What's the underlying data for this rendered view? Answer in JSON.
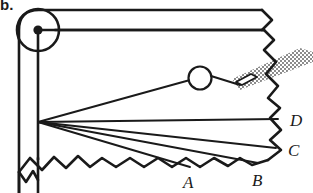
{
  "figure": {
    "title_marker": "b.",
    "type": "optics-ray-diagram",
    "background_color": "#ffffff",
    "stroke_color": "#1a1a1a",
    "hatch_color": "#9a9a9a",
    "canvas": {
      "width": 313,
      "height": 193
    },
    "labels": [
      {
        "id": "A",
        "text": "A",
        "x": 190,
        "y": 188
      },
      {
        "id": "B",
        "text": "B",
        "x": 258,
        "y": 186
      },
      {
        "id": "C",
        "text": "C",
        "x": 290,
        "y": 155
      },
      {
        "id": "D",
        "text": "D",
        "x": 292,
        "y": 124
      }
    ],
    "pivot": {
      "label": "pivot-dot",
      "cx": 38,
      "cy": 30,
      "r": 4
    },
    "pulley": {
      "label": "pulley-circle",
      "cx": 38,
      "cy": 30,
      "r": 21
    },
    "lens_circle": {
      "label": "small-circle",
      "cx": 200,
      "cy": 78,
      "r": 11
    },
    "vertex": {
      "label": "ray-origin",
      "x": 38,
      "y": 122
    },
    "rays": [
      {
        "id": "ray-to-circle",
        "x1": 38,
        "y1": 122,
        "x2": 190,
        "y2": 80
      },
      {
        "id": "ray-D",
        "x1": 38,
        "y1": 122,
        "x2": 278,
        "y2": 119
      },
      {
        "id": "ray-C",
        "x1": 38,
        "y1": 122,
        "x2": 276,
        "y2": 148
      },
      {
        "id": "ray-B",
        "x1": 38,
        "y1": 122,
        "x2": 258,
        "y2": 163
      },
      {
        "id": "ray-A",
        "x1": 38,
        "y1": 122,
        "x2": 190,
        "y2": 167
      }
    ],
    "beam": {
      "id": "hatched-beam",
      "note": "diagonal shaded band entering from upper right",
      "points": "232,79 300,48 313,52 313,62 240,90"
    },
    "aperture": {
      "id": "aperture-slit",
      "note": "small white parallelogram on the beam",
      "points": "236,81 250,74 256,77 242,84"
    }
  }
}
